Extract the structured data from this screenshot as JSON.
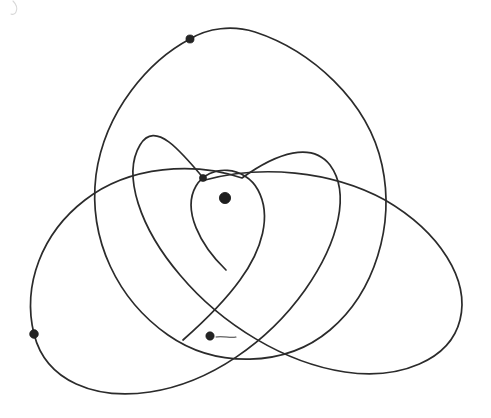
{
  "figure": {
    "caption": "Hand-drawn trajectory diagram: three large petal-shaped orbital loops in threefold symmetry about a central mass, with an inner teardrop loop.",
    "background_color": "#ffffff",
    "ink_color": "#2b2b2b",
    "marker_color": "#242424",
    "width": 491,
    "height": 418
  },
  "chart_data": {
    "type": "line",
    "xlabel": "",
    "ylabel": "",
    "xlim": [
      0,
      491
    ],
    "ylim": [
      0,
      418
    ],
    "grid": false,
    "legend": "none",
    "annotations": [
      "central mass blob",
      "orbiting body on upper-left arc",
      "orbiting body on left lobe apex",
      "orbiting body on lower-center arc",
      "orbiting body on inner teardrop loop"
    ],
    "series": [
      {
        "name": "outer-loop-a",
        "role": "large petal loop leaning upper-left",
        "path": "M 190 39 C 150 60 105 110 96 175 C 88 240 118 300 168 335 C 215 368 285 368 330 330 C 375 292 395 225 382 165 C 368 100 310 50 255 32 C 232 25 208 28 190 39 Z"
      },
      {
        "name": "outer-loop-b",
        "role": "large petal loop leaning right / lower-right",
        "path": "M 205 180 C 260 165 330 170 385 200 C 440 232 470 280 460 320 C 450 360 400 380 345 372 C 285 363 222 325 180 275 C 140 228 122 175 140 145 C 155 120 180 150 205 180 Z"
      },
      {
        "name": "outer-loop-c",
        "role": "large petal loop leaning lower-left",
        "path": "M 242 178 C 195 162 130 165 85 200 C 42 233 22 285 34 334 C 46 382 96 400 150 392 C 210 383 268 342 305 290 C 340 240 350 192 330 165 C 312 142 278 152 242 178 Z"
      },
      {
        "name": "inner-teardrop-loop",
        "role": "small inner loop around the central mass",
        "path": "M 226 270 C 200 245 182 210 196 186 C 210 163 245 166 258 190 C 272 216 262 250 240 280 C 222 305 200 325 183 340"
      }
    ],
    "markers": [
      {
        "name": "orbiting-body-top",
        "x": 190,
        "y": 39,
        "r": 4.1
      },
      {
        "name": "orbiting-body-left",
        "x": 34,
        "y": 334,
        "r": 4.4
      },
      {
        "name": "orbiting-body-bottom",
        "x": 210,
        "y": 336,
        "r": 4.2
      },
      {
        "name": "orbiting-body-inner",
        "x": 203,
        "y": 178,
        "r": 3.6
      },
      {
        "name": "central-mass",
        "x": 225,
        "y": 198,
        "r": 5.6
      }
    ]
  }
}
